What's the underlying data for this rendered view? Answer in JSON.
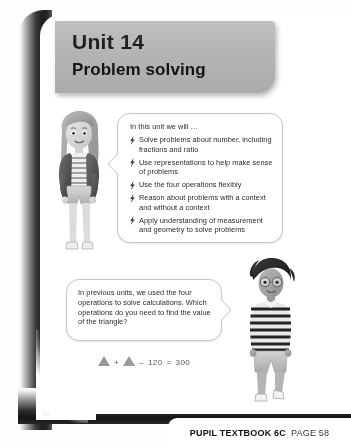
{
  "header": {
    "unit_label": "Unit 14",
    "subtitle": "Problem solving",
    "banner_color": "#b4b4b4"
  },
  "objectives_bubble": {
    "intro": "In this unit we will …",
    "bullet_icon": "lightning-bolt-icon",
    "items": [
      "Solve problems about number, including fractions and ratio",
      "Use representations to help make sense of problems",
      "Use the four operations flexibly",
      "Reason about problems with a context and without a context",
      "Apply understanding of measurement and geometry to solve problems"
    ]
  },
  "question_bubble": {
    "text": "In previous units, we used the four operations to solve calculations. Which operations do you need to find the value of the triangle?"
  },
  "equation": {
    "triangle_glyph": "triangle-icon",
    "plus": "+",
    "minus": "–",
    "subtrahend": "120",
    "equals": "=",
    "result": "300",
    "full_text": "△ + △ – 120 = 300"
  },
  "characters": [
    {
      "name": "girl-character",
      "description": "Girl with long hair, dark jacket and striped top"
    },
    {
      "name": "boy-character",
      "description": "Boy with glasses and striped long-sleeve top"
    }
  ],
  "footer": {
    "page_number": "58",
    "book_label": "PUPIL TEXTBOOK 6C",
    "page_label": "PAGE 58"
  }
}
